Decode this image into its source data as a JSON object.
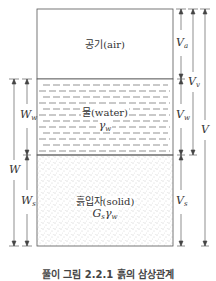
{
  "figure": {
    "caption": "풀이 그림 2.2.1 흙의 삼상관계",
    "phases": {
      "air": {
        "label": "공기(air)"
      },
      "water": {
        "label": "물(water)",
        "symbol": "γ",
        "symbol_sub": "w"
      },
      "solid": {
        "label": "흙입자(solid)",
        "symbol_main": "G",
        "symbol_main_sub": "s",
        "symbol_gamma": "γ",
        "symbol_gamma_sub": "w"
      }
    },
    "left_dimensions": {
      "W": {
        "main": "W",
        "sub": ""
      },
      "Ww": {
        "main": "W",
        "sub": "w"
      },
      "Ws": {
        "main": "W",
        "sub": "s"
      }
    },
    "right_dimensions": {
      "Va": {
        "main": "V",
        "sub": "a"
      },
      "Vv": {
        "main": "V",
        "sub": "v"
      },
      "Vw": {
        "main": "V",
        "sub": "w"
      },
      "Vs": {
        "main": "V",
        "sub": "s"
      },
      "V": {
        "main": "V",
        "sub": ""
      }
    },
    "colors": {
      "line": "#555555",
      "dots": "#888888",
      "background": "#ffffff"
    }
  }
}
